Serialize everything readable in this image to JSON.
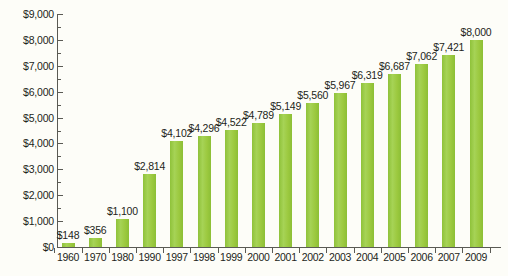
{
  "chart_data": {
    "type": "bar",
    "title": "",
    "xlabel": "",
    "ylabel": "",
    "ylim": [
      0,
      9000
    ],
    "grid": false,
    "legend": "none",
    "y_ticks": [
      "$0",
      "$1,000",
      "$2,000",
      "$3,000",
      "$4,000",
      "$5,000",
      "$6,000",
      "$7,000",
      "$8,000",
      "$9,000"
    ],
    "y_tick_values": [
      0,
      1000,
      2000,
      3000,
      4000,
      5000,
      6000,
      7000,
      8000,
      9000
    ],
    "categories": [
      "1960",
      "1970",
      "1980",
      "1990",
      "1997",
      "1998",
      "1999",
      "2000",
      "2001",
      "2002",
      "2003",
      "2004",
      "2005",
      "2006",
      "2007",
      "2009"
    ],
    "values": [
      148,
      356,
      1100,
      2814,
      4102,
      4296,
      4522,
      4789,
      5149,
      5560,
      5967,
      6319,
      6687,
      7062,
      7421,
      8000
    ],
    "data_labels": [
      "$148",
      "$356",
      "$1,100",
      "$2,814",
      "$4,102",
      "$4,296",
      "$4,522",
      "$4,789",
      "$5,149",
      "$5,560",
      "$5,967",
      "$6,319",
      "$6,687",
      "$7,062",
      "$7,421",
      "$8,000"
    ],
    "bar_color": "#9aca3c",
    "background_color": "#fdfdf8",
    "axis_color": "#5a5a54",
    "text_color": "#231f20"
  }
}
